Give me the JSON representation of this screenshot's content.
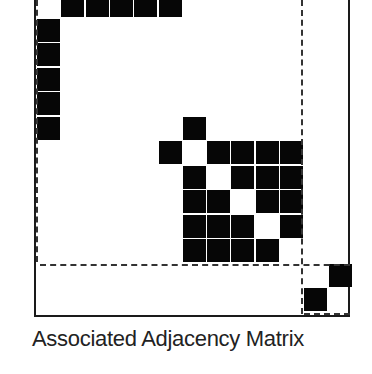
{
  "diagram": {
    "caption": "Associated Adjacency Matrix",
    "colors": {
      "filled": "#060606",
      "empty": "#ffffff",
      "frame": "#1a1a1a",
      "caption": "#222222"
    },
    "grid": {
      "origin_x": 37,
      "origin_y": -6,
      "pitch_x": 24.3,
      "pitch_y": 24.5,
      "cell_size": 23,
      "filled_cells": [
        [
          0,
          1
        ],
        [
          0,
          2
        ],
        [
          0,
          3
        ],
        [
          0,
          4
        ],
        [
          0,
          5
        ],
        [
          1,
          0
        ],
        [
          2,
          0
        ],
        [
          3,
          0
        ],
        [
          4,
          0
        ],
        [
          5,
          0
        ],
        [
          5,
          6
        ],
        [
          6,
          5
        ],
        [
          6,
          7
        ],
        [
          6,
          8
        ],
        [
          6,
          9
        ],
        [
          6,
          10
        ],
        [
          7,
          6
        ],
        [
          7,
          8
        ],
        [
          7,
          9
        ],
        [
          7,
          10
        ],
        [
          8,
          6
        ],
        [
          8,
          7
        ],
        [
          8,
          9
        ],
        [
          8,
          10
        ],
        [
          9,
          6
        ],
        [
          9,
          7
        ],
        [
          9,
          8
        ],
        [
          9,
          10
        ],
        [
          10,
          6
        ],
        [
          10,
          7
        ],
        [
          10,
          8
        ],
        [
          10,
          9
        ],
        [
          11,
          12
        ],
        [
          12,
          11
        ]
      ]
    },
    "blocks": [
      {
        "name": "block-1",
        "rows": [
          0,
          5
        ],
        "cols": [
          0,
          5
        ]
      },
      {
        "name": "block-2",
        "rows": [
          5,
          10
        ],
        "cols": [
          5,
          10
        ]
      },
      {
        "name": "block-3",
        "rows": [
          11,
          12
        ],
        "cols": [
          11,
          12
        ]
      }
    ]
  }
}
